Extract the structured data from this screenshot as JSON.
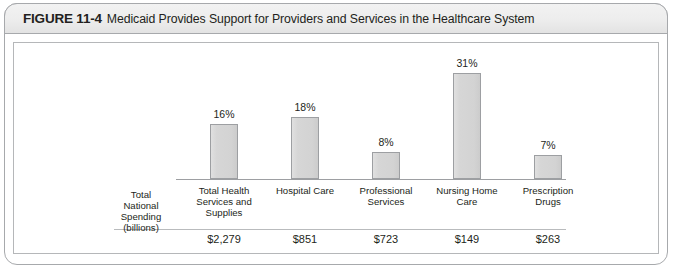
{
  "figure": {
    "number": "FIGURE 11-4",
    "title": "Medicaid Provides Support for Providers and Services in the Healthcare System"
  },
  "row_label": "Total\nNational\nSpending\n(billions)",
  "row_label_lines": [
    "Total",
    "National",
    "Spending",
    "(billions)"
  ],
  "colors": {
    "bar_fill": "#d4d4d4",
    "bar_border": "#9d9fa2",
    "frame_border": "#a7a9ac",
    "header_background": "#ededed",
    "text": "#231f20"
  },
  "chart_data": {
    "type": "bar",
    "title": "Medicaid Provides Support for Providers and Services in the Healthcare System",
    "xlabel": "",
    "ylabel": "",
    "ylim": [
      0,
      35
    ],
    "grid": false,
    "legend": "none",
    "categories": [
      "Total Health Services and Supplies",
      "Hospital Care",
      "Professional Services",
      "Nursing Home Care",
      "Prescription Drugs"
    ],
    "category_lines": [
      [
        "Total Health",
        "Services and",
        "Supplies"
      ],
      [
        "Hospital Care"
      ],
      [
        "Professional",
        "Services"
      ],
      [
        "Nursing Home",
        "Care"
      ],
      [
        "Prescription",
        "Drugs"
      ]
    ],
    "values": [
      16,
      18,
      8,
      31,
      7
    ],
    "value_labels": [
      "16%",
      "18%",
      "8%",
      "31%",
      "7%"
    ],
    "secondary_row_label": "Total National Spending (billions)",
    "secondary_values": [
      2279,
      851,
      723,
      149,
      263
    ],
    "secondary_value_labels": [
      "$2,279",
      "$851",
      "$723",
      "$149",
      "$263"
    ]
  }
}
